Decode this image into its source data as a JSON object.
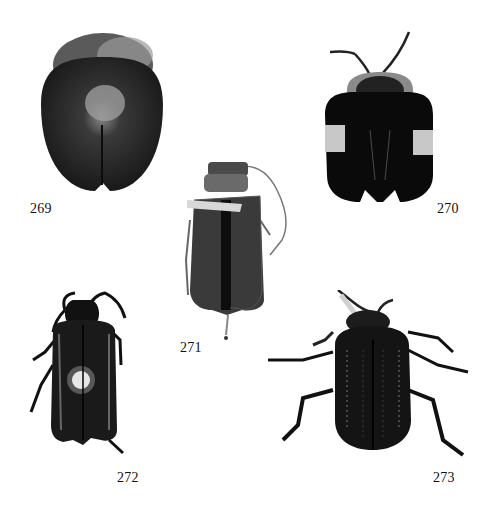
{
  "plate": {
    "figures": [
      {
        "number": "269",
        "description": "Rounded oval beetle, dorsal view, dark mottled elytra with pale central patch"
      },
      {
        "number": "270",
        "description": "Tortoise-like beetle, dorsal view, black elytra with pale lateral bands, long antennae"
      },
      {
        "number": "271",
        "description": "Elongate beetle, dorsal view, dark elytra, long antenna"
      },
      {
        "number": "272",
        "description": "Elongate dark beetle, dorsal view, long antennae and legs"
      },
      {
        "number": "273",
        "description": "Oval shiny dark beetle, dorsal view, legs extended, punctate elytra"
      }
    ]
  }
}
